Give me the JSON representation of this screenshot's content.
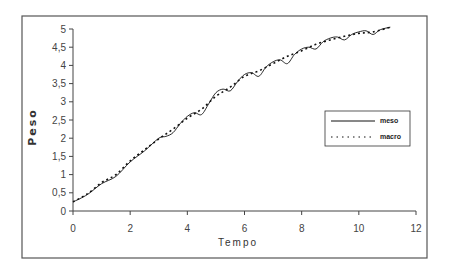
{
  "chart_data": {
    "type": "line",
    "title": "",
    "xlabel": "Tempo",
    "ylabel": "Peso",
    "xlim": [
      0,
      12
    ],
    "ylim": [
      0,
      5
    ],
    "xticks": [
      0,
      2,
      4,
      6,
      8,
      10,
      12
    ],
    "xtick_labels": [
      "0",
      "2",
      "4",
      "6",
      "8",
      "10",
      "12"
    ],
    "yticks": [
      0,
      0.5,
      1,
      1.5,
      2,
      2.5,
      3,
      3.5,
      4,
      4.5,
      5
    ],
    "ytick_labels": [
      "0",
      "0,5",
      "1",
      "1,5",
      "2",
      "2,5",
      "3",
      "3,5",
      "4",
      "4,5",
      "5"
    ],
    "grid": false,
    "legend_position": "right",
    "series": [
      {
        "name": "meso",
        "style": "solid",
        "x": [
          0,
          0.5,
          1,
          1.5,
          2,
          2.5,
          3,
          3.25,
          3.5,
          3.75,
          4,
          4.25,
          4.5,
          4.75,
          5,
          5.25,
          5.5,
          5.75,
          6,
          6.25,
          6.5,
          6.75,
          7,
          7.25,
          7.5,
          7.75,
          8,
          8.25,
          8.5,
          8.75,
          9,
          9.25,
          9.5,
          9.75,
          10,
          10.25,
          10.5,
          10.75,
          11.1
        ],
        "values": [
          0.25,
          0.45,
          0.75,
          0.95,
          1.35,
          1.65,
          2.0,
          2.05,
          2.15,
          2.4,
          2.6,
          2.7,
          2.65,
          2.95,
          3.25,
          3.35,
          3.3,
          3.55,
          3.75,
          3.8,
          3.7,
          3.95,
          4.1,
          4.15,
          4.05,
          4.3,
          4.45,
          4.5,
          4.45,
          4.65,
          4.75,
          4.78,
          4.7,
          4.85,
          4.92,
          4.95,
          4.85,
          4.98,
          5.05
        ]
      },
      {
        "name": "macro",
        "style": "dotted",
        "x": [
          0,
          0.5,
          1,
          1.5,
          2,
          2.5,
          3,
          3.5,
          4,
          4.5,
          5,
          5.5,
          6,
          6.5,
          7,
          7.5,
          8,
          8.5,
          9,
          9.5,
          10,
          10.5,
          11.1
        ],
        "values": [
          0.25,
          0.47,
          0.78,
          1.0,
          1.38,
          1.68,
          1.98,
          2.25,
          2.55,
          2.8,
          3.15,
          3.4,
          3.7,
          3.85,
          4.05,
          4.25,
          4.4,
          4.58,
          4.7,
          4.8,
          4.88,
          4.92,
          5.05
        ]
      }
    ]
  }
}
